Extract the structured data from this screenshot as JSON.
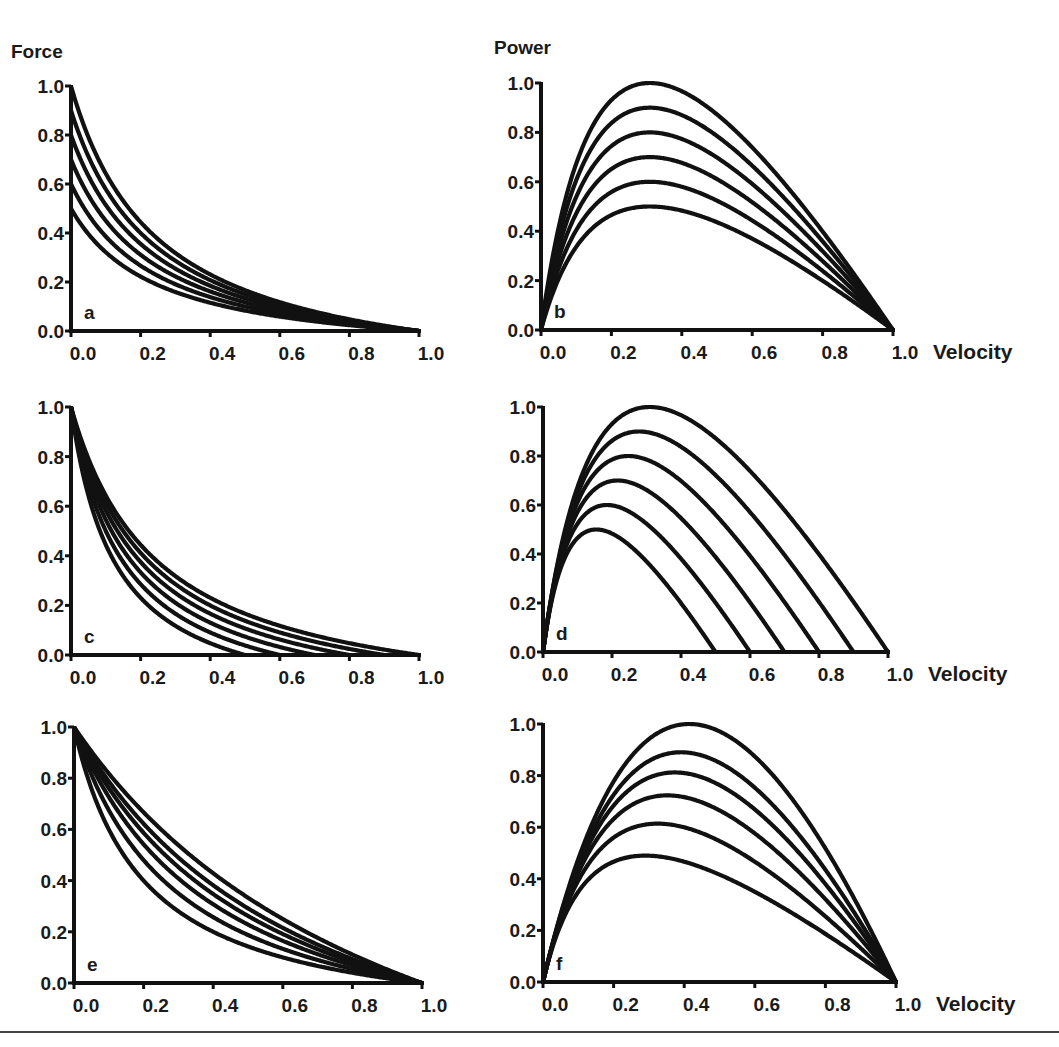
{
  "figure": {
    "left_column_ylabel": "Force",
    "right_column_ylabel": "Power",
    "xlabel": "Velocity",
    "caption_clipped": "Figure caption text (clipped below rule)"
  },
  "chart_data": [
    {
      "panel": "a",
      "type": "line",
      "ylabel": "Force",
      "xlabel": "",
      "x_ticks": [
        "0.0",
        "0.2",
        "0.4",
        "0.6",
        "0.8",
        "1.0"
      ],
      "y_ticks": [
        "0.0",
        "0.2",
        "0.4",
        "0.6",
        "0.8",
        "1.0"
      ],
      "xlim": [
        0,
        1
      ],
      "ylim": [
        0,
        1
      ],
      "model": "hill",
      "description": "Force-velocity curves with varying isometric force F0, same vmax and curvature",
      "series": [
        {
          "name": "F0=1.0",
          "F0": 1.0,
          "vmax": 1.0,
          "k": 0.25
        },
        {
          "name": "F0=0.9",
          "F0": 0.9,
          "vmax": 1.0,
          "k": 0.25
        },
        {
          "name": "F0=0.8",
          "F0": 0.8,
          "vmax": 1.0,
          "k": 0.25
        },
        {
          "name": "F0=0.7",
          "F0": 0.7,
          "vmax": 1.0,
          "k": 0.25
        },
        {
          "name": "F0=0.6",
          "F0": 0.6,
          "vmax": 1.0,
          "k": 0.25
        },
        {
          "name": "F0=0.5",
          "F0": 0.5,
          "vmax": 1.0,
          "k": 0.25
        }
      ]
    },
    {
      "panel": "b",
      "type": "line",
      "ylabel": "Power",
      "xlabel": "Velocity",
      "x_ticks": [
        "0.0",
        "0.2",
        "0.4",
        "0.6",
        "0.8",
        "1.0"
      ],
      "y_ticks": [
        "0.0",
        "0.2",
        "0.4",
        "0.6",
        "0.8",
        "1.0"
      ],
      "xlim": [
        0,
        1
      ],
      "ylim": [
        0,
        1
      ],
      "model": "hill-power",
      "peak_values": [
        1.0,
        0.9,
        0.8,
        0.7,
        0.6,
        0.5
      ],
      "peak_velocity": 0.3,
      "series": [
        {
          "name": "F0=1.0",
          "F0": 1.0,
          "vmax": 1.0,
          "k": 0.25
        },
        {
          "name": "F0=0.9",
          "F0": 0.9,
          "vmax": 1.0,
          "k": 0.25
        },
        {
          "name": "F0=0.8",
          "F0": 0.8,
          "vmax": 1.0,
          "k": 0.25
        },
        {
          "name": "F0=0.7",
          "F0": 0.7,
          "vmax": 1.0,
          "k": 0.25
        },
        {
          "name": "F0=0.6",
          "F0": 0.6,
          "vmax": 1.0,
          "k": 0.25
        },
        {
          "name": "F0=0.5",
          "F0": 0.5,
          "vmax": 1.0,
          "k": 0.25
        }
      ]
    },
    {
      "panel": "c",
      "type": "line",
      "ylabel": "Force",
      "xlabel": "",
      "x_ticks": [
        "0.0",
        "0.2",
        "0.4",
        "0.6",
        "0.8",
        "1.0"
      ],
      "y_ticks": [
        "0.0",
        "0.2",
        "0.4",
        "0.6",
        "0.8",
        "1.0"
      ],
      "xlim": [
        0,
        1
      ],
      "ylim": [
        0,
        1
      ],
      "model": "hill",
      "description": "Force-velocity curves with varying vmax, same F0 and curvature",
      "series": [
        {
          "name": "vmax=1.0",
          "F0": 1.0,
          "vmax": 1.0,
          "k": 0.25
        },
        {
          "name": "vmax=0.9",
          "F0": 1.0,
          "vmax": 0.9,
          "k": 0.25
        },
        {
          "name": "vmax=0.8",
          "F0": 1.0,
          "vmax": 0.8,
          "k": 0.25
        },
        {
          "name": "vmax=0.7",
          "F0": 1.0,
          "vmax": 0.7,
          "k": 0.25
        },
        {
          "name": "vmax=0.6",
          "F0": 1.0,
          "vmax": 0.6,
          "k": 0.25
        },
        {
          "name": "vmax=0.5",
          "F0": 1.0,
          "vmax": 0.5,
          "k": 0.25
        }
      ]
    },
    {
      "panel": "d",
      "type": "line",
      "ylabel": "Power",
      "xlabel": "Velocity",
      "x_ticks": [
        "0.0",
        "0.2",
        "0.4",
        "0.6",
        "0.8",
        "1.0"
      ],
      "y_ticks": [
        "0.0",
        "0.2",
        "0.4",
        "0.6",
        "0.8",
        "1.0"
      ],
      "xlim": [
        0,
        1
      ],
      "ylim": [
        0,
        1
      ],
      "model": "hill-power",
      "peak_values": [
        1.0,
        0.9,
        0.8,
        0.7,
        0.6,
        0.5
      ],
      "x_intercepts": [
        1.0,
        0.9,
        0.8,
        0.7,
        0.6,
        0.5
      ],
      "series": [
        {
          "name": "vmax=1.0",
          "F0": 1.0,
          "vmax": 1.0,
          "k": 0.25
        },
        {
          "name": "vmax=0.9",
          "F0": 1.0,
          "vmax": 0.9,
          "k": 0.25
        },
        {
          "name": "vmax=0.8",
          "F0": 1.0,
          "vmax": 0.8,
          "k": 0.25
        },
        {
          "name": "vmax=0.7",
          "F0": 1.0,
          "vmax": 0.7,
          "k": 0.25
        },
        {
          "name": "vmax=0.6",
          "F0": 1.0,
          "vmax": 0.6,
          "k": 0.25
        },
        {
          "name": "vmax=0.5",
          "F0": 1.0,
          "vmax": 0.5,
          "k": 0.25
        }
      ]
    },
    {
      "panel": "e",
      "type": "line",
      "ylabel": "Force",
      "xlabel": "",
      "x_ticks": [
        "0.0",
        "0.2",
        "0.4",
        "0.6",
        "0.8",
        "1.0"
      ],
      "y_ticks": [
        "0.0",
        "0.2",
        "0.4",
        "0.6",
        "0.8",
        "1.0"
      ],
      "xlim": [
        0,
        1
      ],
      "ylim": [
        0,
        1
      ],
      "model": "hill",
      "description": "Force-velocity curves with varying curvature, same F0 and vmax",
      "series": [
        {
          "name": "k=1.0",
          "F0": 1.0,
          "vmax": 1.0,
          "k": 1.0
        },
        {
          "name": "k=0.7",
          "F0": 1.0,
          "vmax": 1.0,
          "k": 0.7
        },
        {
          "name": "k=0.55",
          "F0": 1.0,
          "vmax": 1.0,
          "k": 0.55
        },
        {
          "name": "k=0.42",
          "F0": 1.0,
          "vmax": 1.0,
          "k": 0.42
        },
        {
          "name": "k=0.3",
          "F0": 1.0,
          "vmax": 1.0,
          "k": 0.3
        },
        {
          "name": "k=0.2",
          "F0": 1.0,
          "vmax": 1.0,
          "k": 0.2
        }
      ]
    },
    {
      "panel": "f",
      "type": "line",
      "ylabel": "Power",
      "xlabel": "Velocity",
      "x_ticks": [
        "0.0",
        "0.2",
        "0.4",
        "0.6",
        "0.8",
        "1.0"
      ],
      "y_ticks": [
        "0.0",
        "0.2",
        "0.4",
        "0.6",
        "0.8",
        "1.0"
      ],
      "xlim": [
        0,
        1
      ],
      "ylim": [
        0,
        1
      ],
      "model": "hill-power",
      "peak_values": [
        1.0,
        0.94,
        0.87,
        0.79,
        0.68,
        0.55
      ],
      "series": [
        {
          "name": "k=1.0",
          "F0": 1.0,
          "vmax": 1.0,
          "k": 1.0
        },
        {
          "name": "k=0.7",
          "F0": 1.0,
          "vmax": 1.0,
          "k": 0.7
        },
        {
          "name": "k=0.55",
          "F0": 1.0,
          "vmax": 1.0,
          "k": 0.55
        },
        {
          "name": "k=0.42",
          "F0": 1.0,
          "vmax": 1.0,
          "k": 0.42
        },
        {
          "name": "k=0.3",
          "F0": 1.0,
          "vmax": 1.0,
          "k": 0.3
        },
        {
          "name": "k=0.2",
          "F0": 1.0,
          "vmax": 1.0,
          "k": 0.2
        }
      ]
    }
  ]
}
